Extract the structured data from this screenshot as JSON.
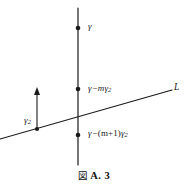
{
  "figure": {
    "caption_symbol": "図",
    "caption_text": "A. 3",
    "background_color": "#ffffff",
    "ink_color": "#1a1a1a"
  },
  "diagram": {
    "vertical_line": {
      "name": "vertical-axis-line",
      "x": 78,
      "y_top": 8,
      "y_bottom": 165
    },
    "slanted_line": {
      "name": "line-L",
      "x1": 0,
      "y1": 139,
      "x2": 172,
      "y2": 90,
      "label": "L"
    },
    "measure_arrow": {
      "name": "gamma2-measure-arrow",
      "x": 37,
      "y_base": 129,
      "y_tip": 88,
      "label": "γ₂"
    },
    "points": [
      {
        "name": "point-gamma",
        "x": 78,
        "y": 28,
        "label_parts": {
          "var": "γ",
          "op": "",
          "mid": "",
          "sub": ""
        },
        "label_plain": "γ"
      },
      {
        "name": "point-gamma-minus-m-gamma2",
        "x": 78,
        "y": 89,
        "label_parts": {
          "var": "γ",
          "op": "−",
          "mid": "mγ",
          "sub": "2"
        },
        "label_plain": "γ−mγ₂"
      },
      {
        "name": "point-gamma-minus-m-plus-1-gamma2",
        "x": 78,
        "y": 135,
        "label_parts": {
          "var": "γ",
          "op": "−",
          "mid": "(m+1)γ",
          "sub": "2"
        },
        "label_plain": "γ−(m+1)γ₂"
      }
    ],
    "intersection": {
      "name": "lines-intersection",
      "x": 78,
      "y": 113
    },
    "line_endpoint_dot": {
      "name": "line-L-left-dot",
      "x": 37,
      "y": 129
    }
  },
  "labels": {
    "gamma_top": {
      "var": "γ"
    },
    "gamma_mid": {
      "var": "γ",
      "op": "−",
      "mid": "m",
      "tail": "γ",
      "sub": "2"
    },
    "gamma_bot": {
      "var": "γ",
      "op": "−",
      "mid": "(m+1)",
      "tail": "γ",
      "sub": "2"
    },
    "gamma_two": {
      "var": "γ",
      "sub": "2"
    },
    "line_l": {
      "text": "L"
    }
  }
}
